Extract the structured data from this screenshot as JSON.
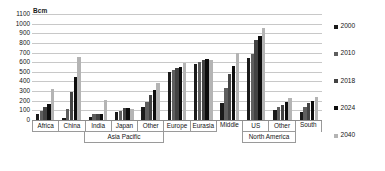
{
  "chart_data": {
    "type": "bar",
    "title": "",
    "subtitle": "",
    "unit_label": "Bcm",
    "xlabel": "",
    "ylabel": "",
    "ylim": [
      0,
      1100
    ],
    "ytick_step": 100,
    "yticks": [
      "1100",
      "1000",
      "900",
      "800",
      "700",
      "600",
      "500",
      "400",
      "300",
      "200",
      "100",
      "0"
    ],
    "grid": true,
    "grid_axis": "y",
    "legend_position": "right",
    "categories": [
      "Africa",
      "China",
      "India",
      "Japan",
      "Other",
      "Europe",
      "Eurasia",
      "Middle East",
      "US",
      "Other",
      "South America"
    ],
    "category_lines": [
      {
        "line1": "Africa",
        "line2": ""
      },
      {
        "line1": "China",
        "line2": ""
      },
      {
        "line1": "India",
        "line2": ""
      },
      {
        "line1": "Japan",
        "line2": ""
      },
      {
        "line1": "Other",
        "line2": ""
      },
      {
        "line1": "Europe",
        "line2": ""
      },
      {
        "line1": "Eurasia",
        "line2": ""
      },
      {
        "line1": "Middle",
        "line2": "East"
      },
      {
        "line1": "US",
        "line2": ""
      },
      {
        "line1": "Other",
        "line2": ""
      },
      {
        "line1": "South",
        "line2": "America"
      }
    ],
    "region_groups": [
      {
        "label": "",
        "span": 2,
        "boxed": false
      },
      {
        "label": "Asia Pacific",
        "span": 3,
        "boxed": true
      },
      {
        "label": "",
        "span": 3,
        "boxed": false
      },
      {
        "label": "North America",
        "span": 2,
        "boxed": true
      },
      {
        "label": "",
        "span": 1,
        "boxed": false
      }
    ],
    "series": [
      {
        "name": "2000",
        "color": "#1a1a1a",
        "values": [
          60,
          25,
          28,
          78,
          140,
          500,
          580,
          180,
          640,
          105,
          85
        ]
      },
      {
        "name": "2010",
        "color": "#5e5e5e",
        "values": [
          90,
          110,
          60,
          95,
          190,
          520,
          600,
          330,
          680,
          130,
          140
        ]
      },
      {
        "name": "2018",
        "color": "#434343",
        "values": [
          130,
          290,
          58,
          120,
          260,
          540,
          625,
          480,
          830,
          160,
          175
        ]
      },
      {
        "name": "2024",
        "color": "#0d0d0d",
        "values": [
          170,
          450,
          60,
          125,
          310,
          545,
          630,
          560,
          870,
          190,
          200
        ]
      },
      {
        "name": "2040",
        "color": "#b4b4b4",
        "values": [
          320,
          650,
          210,
          115,
          380,
          590,
          620,
          700,
          960,
          230,
          240
        ]
      }
    ]
  },
  "legend": {
    "items": [
      {
        "label": "2000",
        "color": "#1a1a1a"
      },
      {
        "label": "2010",
        "color": "#5e5e5e"
      },
      {
        "label": "2018",
        "color": "#434343"
      },
      {
        "label": "2024",
        "color": "#0d0d0d"
      },
      {
        "label": "2040",
        "color": "#b4b4b4"
      }
    ]
  }
}
